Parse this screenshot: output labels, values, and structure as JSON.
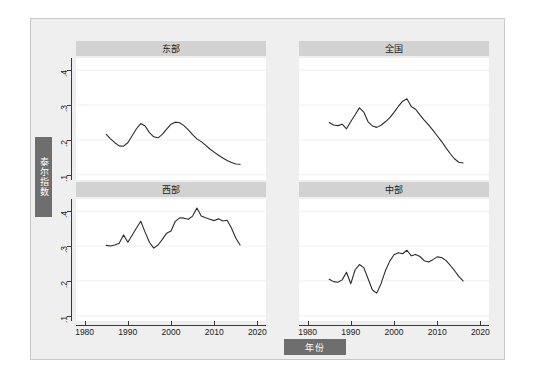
{
  "axes": {
    "ylabel": "泰尔指数",
    "xlabel": "年份",
    "yticks": [
      ".1",
      ".2",
      ".3",
      ".4"
    ],
    "xticks": [
      "1980",
      "1990",
      "2000",
      "2010",
      "2020"
    ]
  },
  "colors": {
    "figure_background": "#efefef",
    "panel_background": "#ffffff",
    "title_banner": "#d2d2d2",
    "axis_badge": "#6e6e6e",
    "line": "#2b2b2b",
    "grid": "#f0f0f0",
    "frame": "#c8c8c8"
  },
  "chart_data": {
    "type": "line",
    "title": "",
    "xlabel": "年份",
    "ylabel": "泰尔指数",
    "xlim": [
      1978,
      2022
    ],
    "ylim": [
      0.085,
      0.435
    ],
    "xticks": [
      1980,
      1990,
      2000,
      2010,
      2020
    ],
    "yticks": [
      0.1,
      0.2,
      0.3,
      0.4
    ],
    "grid": true,
    "legend": "none",
    "layout": "2x2 small-multiples",
    "panels": [
      {
        "name": "east",
        "title": "东部",
        "position": "top-left",
        "x": [
          1985,
          1986,
          1987,
          1988,
          1989,
          1990,
          1991,
          1992,
          1993,
          1994,
          1995,
          1996,
          1997,
          1998,
          1999,
          2000,
          2001,
          2002,
          2003,
          2004,
          2005,
          2006,
          2007,
          2008,
          2009,
          2010,
          2011,
          2012,
          2013,
          2014,
          2015,
          2016
        ],
        "values": [
          0.216,
          0.203,
          0.192,
          0.183,
          0.182,
          0.192,
          0.212,
          0.232,
          0.247,
          0.24,
          0.221,
          0.209,
          0.206,
          0.216,
          0.231,
          0.245,
          0.251,
          0.249,
          0.241,
          0.229,
          0.215,
          0.203,
          0.195,
          0.185,
          0.174,
          0.165,
          0.156,
          0.148,
          0.141,
          0.135,
          0.131,
          0.13
        ]
      },
      {
        "name": "national",
        "title": "全国",
        "position": "top-right",
        "x": [
          1985,
          1986,
          1987,
          1988,
          1989,
          1990,
          1991,
          1992,
          1993,
          1994,
          1995,
          1996,
          1997,
          1998,
          1999,
          2000,
          2001,
          2002,
          2003,
          2004,
          2005,
          2006,
          2007,
          2008,
          2009,
          2010,
          2011,
          2012,
          2013,
          2014,
          2015,
          2016
        ],
        "values": [
          0.25,
          0.243,
          0.241,
          0.245,
          0.232,
          0.253,
          0.272,
          0.292,
          0.28,
          0.252,
          0.24,
          0.236,
          0.242,
          0.252,
          0.263,
          0.279,
          0.296,
          0.311,
          0.318,
          0.296,
          0.288,
          0.272,
          0.257,
          0.243,
          0.228,
          0.212,
          0.196,
          0.178,
          0.161,
          0.146,
          0.136,
          0.134
        ]
      },
      {
        "name": "west",
        "title": "西部",
        "position": "bottom-left",
        "x": [
          1985,
          1986,
          1987,
          1988,
          1989,
          1990,
          1991,
          1992,
          1993,
          1994,
          1995,
          1996,
          1997,
          1998,
          1999,
          2000,
          2001,
          2002,
          2003,
          2004,
          2005,
          2006,
          2007,
          2008,
          2009,
          2010,
          2011,
          2012,
          2013,
          2014,
          2015,
          2016
        ],
        "values": [
          0.302,
          0.3,
          0.303,
          0.308,
          0.332,
          0.311,
          0.331,
          0.352,
          0.371,
          0.34,
          0.311,
          0.294,
          0.303,
          0.319,
          0.337,
          0.343,
          0.371,
          0.381,
          0.38,
          0.377,
          0.386,
          0.409,
          0.386,
          0.381,
          0.377,
          0.373,
          0.378,
          0.372,
          0.374,
          0.352,
          0.323,
          0.303
        ]
      },
      {
        "name": "central",
        "title": "中部",
        "position": "bottom-right",
        "x": [
          1985,
          1986,
          1987,
          1988,
          1989,
          1990,
          1991,
          1992,
          1993,
          1994,
          1995,
          1996,
          1997,
          1998,
          1999,
          2000,
          2001,
          2002,
          2003,
          2004,
          2005,
          2006,
          2007,
          2008,
          2009,
          2010,
          2011,
          2012,
          2013,
          2014,
          2015,
          2016
        ],
        "values": [
          0.205,
          0.198,
          0.196,
          0.203,
          0.225,
          0.192,
          0.232,
          0.247,
          0.238,
          0.206,
          0.174,
          0.165,
          0.192,
          0.229,
          0.256,
          0.275,
          0.281,
          0.278,
          0.288,
          0.272,
          0.276,
          0.27,
          0.258,
          0.254,
          0.261,
          0.269,
          0.267,
          0.259,
          0.245,
          0.23,
          0.213,
          0.2
        ]
      }
    ]
  }
}
